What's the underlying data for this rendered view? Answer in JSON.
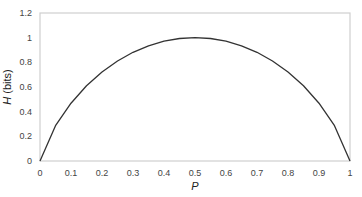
{
  "chart_data": {
    "type": "line",
    "title": "",
    "xlabel": "P",
    "ylabel": "H (bits)",
    "ylabel_parts": {
      "italic": "H",
      "rest": " (bits)"
    },
    "xlim": [
      0,
      1
    ],
    "ylim": [
      0,
      1.2
    ],
    "x_ticks": [
      "0",
      "0.1",
      "0.2",
      "0.3",
      "0.4",
      "0.5",
      "0.6",
      "0.7",
      "0.8",
      "0.9",
      "1"
    ],
    "y_ticks": [
      "0",
      "0.2",
      "0.4",
      "0.6",
      "0.8",
      "1",
      "1.2"
    ],
    "grid": false,
    "legend": null,
    "series": [
      {
        "name": "H(P)",
        "color": "#333333",
        "x": [
          0,
          0.05,
          0.1,
          0.15,
          0.2,
          0.25,
          0.3,
          0.35,
          0.4,
          0.45,
          0.5,
          0.55,
          0.6,
          0.65,
          0.7,
          0.75,
          0.8,
          0.85,
          0.9,
          0.95,
          1
        ],
        "y": [
          0,
          0.286,
          0.469,
          0.61,
          0.722,
          0.811,
          0.881,
          0.934,
          0.971,
          0.993,
          1.0,
          0.993,
          0.971,
          0.934,
          0.881,
          0.811,
          0.722,
          0.61,
          0.469,
          0.286,
          0
        ]
      }
    ]
  },
  "colors": {
    "frame": "#cfcfcf",
    "line": "#333333",
    "text": "#444444"
  }
}
